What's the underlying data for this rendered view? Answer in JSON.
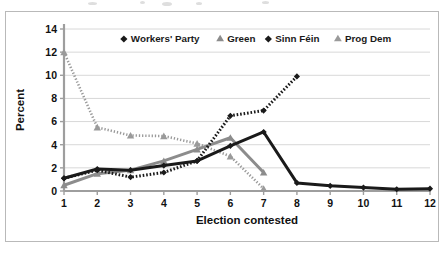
{
  "chart_data": {
    "type": "line",
    "title": "",
    "xlabel": "Election contested",
    "ylabel": "Percent",
    "x": [
      1,
      2,
      3,
      4,
      5,
      6,
      7,
      8,
      9,
      10,
      11,
      12
    ],
    "xlim": [
      1,
      12
    ],
    "ylim": [
      0,
      14
    ],
    "yticks": [
      0,
      2,
      4,
      6,
      8,
      10,
      12,
      14
    ],
    "xticks": [
      1,
      2,
      3,
      4,
      5,
      6,
      7,
      8,
      9,
      10,
      11,
      12
    ],
    "grid": "horizontal",
    "legend_position": "top-center-inside",
    "series": [
      {
        "name": "Workers' Party",
        "color": "#1a1a1a",
        "marker": "diamond",
        "linestyle": "solid",
        "x": [
          1,
          2,
          3,
          4,
          5,
          6,
          7,
          8,
          9,
          10,
          11,
          12
        ],
        "values": [
          1.1,
          1.9,
          1.8,
          2.2,
          2.6,
          3.9,
          5.1,
          0.7,
          0.45,
          0.3,
          0.15,
          0.2
        ]
      },
      {
        "name": "Green",
        "color": "#8c8c8c",
        "marker": "triangle",
        "linestyle": "solid",
        "x": [
          1,
          2,
          3,
          4,
          5,
          6,
          7
        ],
        "values": [
          0.5,
          1.5,
          1.8,
          2.6,
          3.6,
          4.6,
          1.6
        ]
      },
      {
        "name": "Sinn Féin",
        "color": "#1a1a1a",
        "marker": "diamond",
        "linestyle": "dashed",
        "x": [
          1,
          2,
          3,
          4,
          5,
          6,
          7,
          8
        ],
        "values": [
          1.1,
          1.8,
          1.2,
          1.6,
          2.6,
          6.5,
          6.95,
          9.9
        ]
      },
      {
        "name": "Prog Dem",
        "color": "#9a9a9a",
        "marker": "triangle",
        "linestyle": "dotted",
        "x": [
          1,
          2,
          3,
          4,
          5,
          6,
          7
        ],
        "values": [
          12.0,
          5.5,
          4.8,
          4.75,
          4.1,
          3.0,
          0.2
        ]
      }
    ]
  },
  "axes": {
    "y_label": "Percent",
    "x_label": "Election contested",
    "y_tick_labels": [
      "0",
      "2",
      "4",
      "6",
      "8",
      "10",
      "12",
      "14"
    ],
    "x_tick_labels": [
      "1",
      "2",
      "3",
      "4",
      "5",
      "6",
      "7",
      "8",
      "9",
      "10",
      "11",
      "12"
    ]
  },
  "legend": {
    "entries": [
      {
        "label": "Workers' Party",
        "marker": "diamond-marker",
        "color": "#1a1a1a"
      },
      {
        "label": "Green",
        "marker": "triangle-marker",
        "color": "#8c8c8c"
      },
      {
        "label": "Sinn Féin",
        "marker": "diamond-marker",
        "color": "#1a1a1a"
      },
      {
        "label": "Prog Dem",
        "marker": "triangle-marker",
        "color": "#9a9a9a"
      }
    ]
  },
  "colors": {
    "frame_border": "#b9b9b9",
    "axis_line": "#9e9e9e",
    "gridline": "#d8d8d8",
    "background": "#ffffff"
  }
}
